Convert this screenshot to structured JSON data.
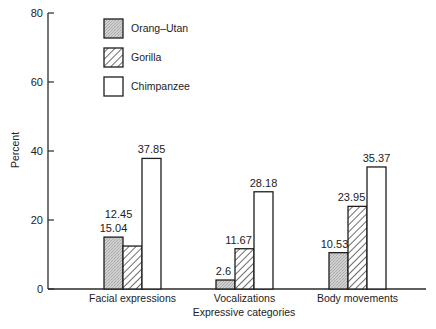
{
  "chart_data": {
    "type": "bar",
    "title": "",
    "xlabel": "Expressive categories",
    "ylabel": "Percent",
    "ylim": [
      0,
      80
    ],
    "yticks": [
      0,
      20,
      40,
      60,
      80
    ],
    "grid": false,
    "legend_position": "upper-left (inside plot)",
    "categories": [
      "Facial expressions",
      "Vocalizations",
      "Body movements"
    ],
    "series": [
      {
        "name": "Orang–Utan",
        "fill": "stipple-gray",
        "values": [
          15.04,
          2.6,
          10.53
        ],
        "labels": [
          "15.04",
          "2.6",
          "10.53"
        ]
      },
      {
        "name": "Gorilla",
        "fill": "diagonal-hatch",
        "values": [
          12.45,
          11.67,
          23.95
        ],
        "labels": [
          "12.45",
          "11.67",
          "23.95"
        ]
      },
      {
        "name": "Chimpanzee",
        "fill": "white",
        "values": [
          37.85,
          28.18,
          35.37
        ],
        "labels": [
          "37.85",
          "28.18",
          "35.37"
        ]
      }
    ]
  },
  "colors": {
    "axis": "#2a2a2a",
    "orang_fill": "#c9c9c9",
    "bar_stroke": "#1e1e1e",
    "background": "#ffffff"
  }
}
